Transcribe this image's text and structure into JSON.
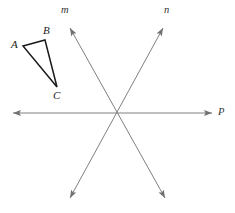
{
  "figure": {
    "type": "geometry-diagram",
    "width": 235,
    "height": 213,
    "background_color": "#ffffff"
  },
  "colors": {
    "line_gray": "#808080",
    "triangle_stroke": "#1a1a1a",
    "label_color": "#1a1a1a",
    "line_label_color": "#333333",
    "background": "#ffffff"
  },
  "triangle": {
    "name": "triangle-abc",
    "stroke_color": "#1a1a1a",
    "stroke_width": 1.5,
    "fill": "none",
    "vertices": [
      {
        "label": "A",
        "x": 23,
        "y": 46,
        "label_x": 11,
        "label_y": 39
      },
      {
        "label": "B",
        "x": 45,
        "y": 40,
        "label_x": 43,
        "label_y": 25
      },
      {
        "label": "C",
        "x": 57,
        "y": 87,
        "label_x": 53,
        "label_y": 90
      }
    ],
    "path": "M 23 46 L 45 40 L 57 87 Z"
  },
  "intersection": {
    "label": "concurrency-point",
    "x": 116,
    "y": 114
  },
  "lines": [
    {
      "name": "line-p",
      "label": "P",
      "orientation": "horizontal",
      "stroke_color": "#808080",
      "stroke_width": 1,
      "x1": 13,
      "y1": 113,
      "x2": 212,
      "y2": 113,
      "arrow_start": true,
      "arrow_end": true,
      "label_x": 218,
      "label_y": 107
    },
    {
      "name": "line-m",
      "label": "m",
      "orientation": "diagonal-upper-left-to-lower-right",
      "stroke_color": "#808080",
      "stroke_width": 1,
      "x1": 70,
      "y1": 28,
      "x2": 165,
      "y2": 198,
      "arrow_start": true,
      "arrow_end": true,
      "label_x": 61,
      "label_y": 5
    },
    {
      "name": "line-n",
      "label": "n",
      "orientation": "diagonal-upper-right-to-lower-left",
      "stroke_color": "#808080",
      "stroke_width": 1,
      "x1": 163,
      "y1": 28,
      "x2": 70,
      "y2": 198,
      "arrow_start": true,
      "arrow_end": true,
      "label_x": 164,
      "label_y": 5
    }
  ]
}
